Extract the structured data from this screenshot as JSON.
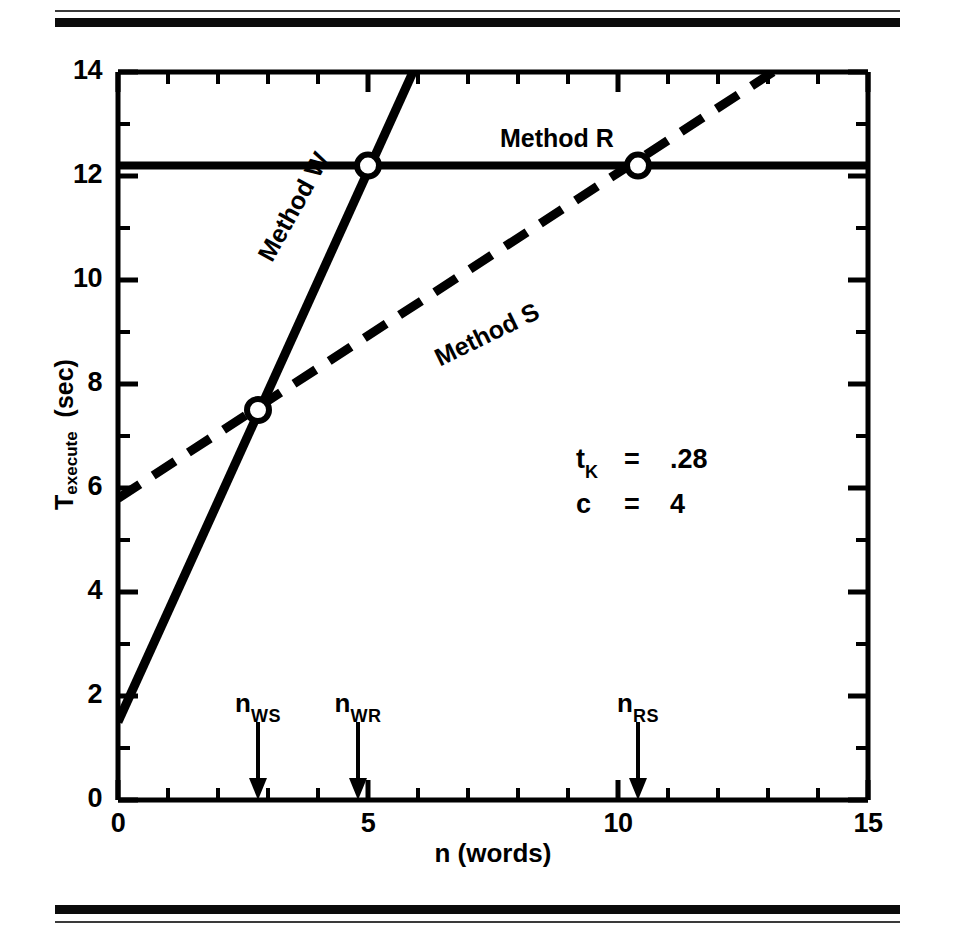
{
  "figure": {
    "top_rule": "horizontal-rule",
    "bottom_rule": "horizontal-rule"
  },
  "chart_data": {
    "type": "line",
    "title": "",
    "xlabel": "n (words)",
    "ylabel": "T_execute (sec)",
    "ylabel_base": "T",
    "ylabel_sub": "execute",
    "ylabel_unit": "(sec)",
    "xlim": [
      0,
      15
    ],
    "ylim": [
      0,
      14
    ],
    "xticks": [
      0,
      5,
      10,
      15
    ],
    "xtick_labels": [
      "0",
      "5",
      "10",
      "15"
    ],
    "x_minor_tick_step": 1,
    "yticks": [
      0,
      2,
      4,
      6,
      8,
      10,
      12,
      14
    ],
    "ytick_labels": [
      "0",
      "2",
      "4",
      "6",
      "8",
      "10",
      "12",
      "14"
    ],
    "y_minor_tick_step": 1,
    "grid": false,
    "legend_position": "inline-labels",
    "series": [
      {
        "name": "Method R",
        "label": "Method R",
        "style": "solid",
        "x": [
          0,
          15
        ],
        "y": [
          12.2,
          12.2
        ],
        "intercept": 12.2,
        "slope": 0
      },
      {
        "name": "Method W",
        "label": "Method W",
        "style": "solid",
        "x": [
          0,
          5.9
        ],
        "y": [
          1.5,
          14.0
        ],
        "intercept": 1.5,
        "slope": 2.12
      },
      {
        "name": "Method S",
        "label": "Method S",
        "style": "dashed",
        "x": [
          0,
          13.1
        ],
        "y": [
          5.8,
          14.0
        ],
        "intercept": 5.8,
        "slope": 0.625
      }
    ],
    "intersections": [
      {
        "name": "n_WS",
        "x": 2.8,
        "y": 7.5,
        "marker": "open-circle"
      },
      {
        "name": "n_WR",
        "x": 5.0,
        "y": 12.2,
        "marker": "open-circle"
      },
      {
        "name": "n_RS",
        "x": 10.4,
        "y": 12.2,
        "marker": "open-circle"
      }
    ],
    "axis_markers": [
      {
        "id": "n-ws",
        "base": "n",
        "sub": "WS",
        "x": 2.8
      },
      {
        "id": "n-wr",
        "base": "n",
        "sub": "WR",
        "x": 4.8
      },
      {
        "id": "n-rs",
        "base": "n",
        "sub": "RS",
        "x": 10.4
      }
    ],
    "annotations": [
      {
        "symbol": "t",
        "symbol_sub": "K",
        "equals": "=",
        "value": ".28"
      },
      {
        "symbol": "c",
        "symbol_sub": "",
        "equals": "=",
        "value": "4"
      }
    ],
    "colors": {
      "line": "#000000",
      "background": "#ffffff",
      "axis": "#000000"
    }
  }
}
